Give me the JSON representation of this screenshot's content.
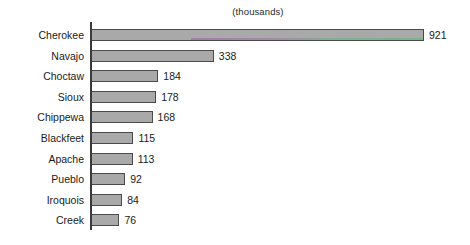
{
  "chart_data": {
    "type": "bar",
    "orientation": "horizontal",
    "title": "(thousands)",
    "subtitle": "",
    "xlabel": "",
    "ylabel": "",
    "grid": false,
    "legend": false,
    "axis_ticks_shown": false,
    "xlim": [
      0,
      921
    ],
    "categories": [
      "Cherokee",
      "Navajo",
      "Choctaw",
      "Sioux",
      "Chippewa",
      "Blackfeet",
      "Apache",
      "Pueblo",
      "Iroquois",
      "Creek"
    ],
    "values": [
      921,
      338,
      184,
      178,
      168,
      115,
      113,
      92,
      84,
      76
    ],
    "value_labels": [
      "921",
      "338",
      "184",
      "178",
      "168",
      "115",
      "113",
      "92",
      "84",
      "76"
    ],
    "bars": [
      {
        "category": "Cherokee",
        "value": 921,
        "label": "921"
      },
      {
        "category": "Navajo",
        "value": 338,
        "label": "338"
      },
      {
        "category": "Choctaw",
        "value": 184,
        "label": "184"
      },
      {
        "category": "Sioux",
        "value": 178,
        "label": "178"
      },
      {
        "category": "Chippewa",
        "value": 168,
        "label": "168"
      },
      {
        "category": "Blackfeet",
        "value": 115,
        "label": "115"
      },
      {
        "category": "Apache",
        "value": 113,
        "label": "113"
      },
      {
        "category": "Pueblo",
        "value": 92,
        "label": "92"
      },
      {
        "category": "Iroquois",
        "value": 84,
        "label": "84"
      },
      {
        "category": "Creek",
        "value": 76,
        "label": "76"
      }
    ],
    "colors": {
      "bar_fill": "#a9a9a9",
      "bar_border": "#4a4a4a",
      "axis": "#3a3a3a",
      "text": "#1a1a1a",
      "background": "#ffffff"
    }
  }
}
